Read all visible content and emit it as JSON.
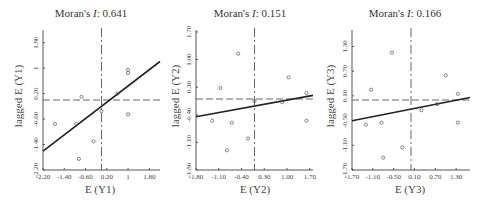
{
  "chart_data": [
    {
      "type": "scatter",
      "title": "Moran's I: 0.641",
      "title_prefix": "Moran's ",
      "title_stat": "I",
      "title_value": ": 0.641",
      "xlabel": "E (Y1)",
      "ylabel": "lagged E (Y1)",
      "xlim": [
        -2.2,
        2.2
      ],
      "ylim": [
        -2.2,
        2.2
      ],
      "xticks": [
        "-2.20",
        "-1.40",
        "-0.60",
        "0.20",
        "1",
        "1.80"
      ],
      "xtick_values": [
        -2.2,
        -1.4,
        -0.6,
        0.2,
        1.0,
        1.8
      ],
      "yticks": [
        "-2.20",
        "-1.40",
        "-0.60",
        "0.20",
        "1",
        "1.80"
      ],
      "ytick_values": [
        -2.2,
        -1.4,
        -0.6,
        0.2,
        1.0,
        1.8
      ],
      "vline_x": 0.0,
      "hline_y": 0.0,
      "regression": {
        "slope": 0.641,
        "intercept": -0.2
      },
      "points": [
        {
          "x": -1.75,
          "y": -0.75
        },
        {
          "x": -0.95,
          "y": -0.75
        },
        {
          "x": -0.75,
          "y": 0.1
        },
        {
          "x": -0.85,
          "y": -1.85
        },
        {
          "x": -0.3,
          "y": -1.3
        },
        {
          "x": 0.0,
          "y": -0.35
        },
        {
          "x": 0.6,
          "y": 0.2
        },
        {
          "x": 1.0,
          "y": 0.95
        },
        {
          "x": 1.0,
          "y": 0.85
        },
        {
          "x": 1.0,
          "y": -0.45
        }
      ],
      "grid": false
    },
    {
      "type": "scatter",
      "title": "Moran's I: 0.151",
      "title_prefix": "Moran's ",
      "title_stat": "I",
      "title_value": ": 0.151",
      "xlabel": "E (Y2)",
      "ylabel": "lagged E (Y2)",
      "xlim": [
        -1.8,
        1.8
      ],
      "ylim": [
        -1.8,
        1.75
      ],
      "xticks": [
        "-1.80",
        "-1.10",
        "-0.40",
        "0.30",
        "1.00",
        "1.70"
      ],
      "xtick_values": [
        -1.8,
        -1.1,
        -0.4,
        0.3,
        1.0,
        1.7
      ],
      "yticks": [
        "-1.80",
        "-1.10",
        "-0.40",
        "0.30",
        "1.00",
        "1.70"
      ],
      "ytick_values": [
        -1.8,
        -1.1,
        -0.4,
        0.3,
        1.0,
        1.7
      ],
      "vline_x": 0.0,
      "hline_y": 0.0,
      "regression": {
        "slope": 0.151,
        "intercept": -0.18
      },
      "points": [
        {
          "x": -1.3,
          "y": -0.55
        },
        {
          "x": -1.05,
          "y": 0.28
        },
        {
          "x": -0.85,
          "y": -1.3
        },
        {
          "x": -0.7,
          "y": -0.6
        },
        {
          "x": -0.5,
          "y": 1.15
        },
        {
          "x": -0.2,
          "y": -1.0
        },
        {
          "x": 0.0,
          "y": -0.05
        },
        {
          "x": 0.85,
          "y": -0.08
        },
        {
          "x": 1.05,
          "y": 0.55
        },
        {
          "x": 1.6,
          "y": 0.15
        },
        {
          "x": 1.6,
          "y": -0.55
        }
      ],
      "grid": false
    },
    {
      "type": "scatter",
      "title": "Moran's I: 0.166",
      "title_prefix": "Moran's ",
      "title_stat": "I",
      "title_value": ": 0.166",
      "xlabel": "E (Y3)",
      "ylabel": "lagged E (Y3)",
      "xlim": [
        -1.7,
        1.7
      ],
      "ylim": [
        -1.7,
        1.7
      ],
      "xticks": [
        "-1.70",
        "-1.10",
        "-0.50",
        "0.10",
        "0.70",
        "1.30"
      ],
      "xtick_values": [
        -1.7,
        -1.1,
        -0.5,
        0.1,
        0.7,
        1.3
      ],
      "yticks": [
        "-1.70",
        "-1.10",
        "-0.50",
        "0.10",
        "0.70",
        "1.30"
      ],
      "ytick_values": [
        -1.7,
        -1.1,
        -0.5,
        0.1,
        0.7,
        1.3
      ],
      "vline_x": 0.0,
      "hline_y": 0.0,
      "regression": {
        "slope": 0.166,
        "intercept": -0.22
      },
      "points": [
        {
          "x": -1.3,
          "y": -0.6
        },
        {
          "x": -1.15,
          "y": 0.25
        },
        {
          "x": -0.85,
          "y": -0.55
        },
        {
          "x": -0.8,
          "y": -1.4
        },
        {
          "x": -0.55,
          "y": 1.15
        },
        {
          "x": -0.25,
          "y": -1.15
        },
        {
          "x": 0.3,
          "y": -0.25
        },
        {
          "x": 0.75,
          "y": -0.1
        },
        {
          "x": 1.0,
          "y": 0.6
        },
        {
          "x": 1.35,
          "y": 0.15
        },
        {
          "x": 1.35,
          "y": -0.55
        }
      ],
      "grid": false
    }
  ]
}
